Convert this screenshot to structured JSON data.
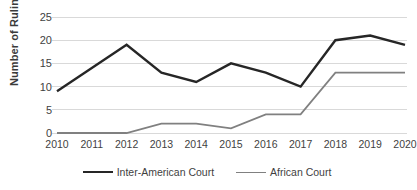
{
  "chart_data": {
    "type": "line",
    "title": "",
    "xlabel": "",
    "ylabel": "Number of Rulings",
    "categories": [
      "2010",
      "2011",
      "2012",
      "2013",
      "2014",
      "2015",
      "2016",
      "2017",
      "2018",
      "2019",
      "2020"
    ],
    "ylim": [
      0,
      25
    ],
    "yticks": [
      "0",
      "5",
      "10",
      "15",
      "20",
      "25"
    ],
    "grid": true,
    "legend_position": "bottom",
    "series": [
      {
        "name": "Inter-American Court",
        "color": "#262626",
        "values": [
          9,
          14,
          19,
          13,
          11,
          15,
          13,
          10,
          20,
          21,
          19
        ]
      },
      {
        "name": "African Court",
        "color": "#808080",
        "values": [
          0,
          0,
          0,
          2,
          2,
          1,
          4,
          4,
          13,
          13,
          13
        ]
      }
    ]
  },
  "axis": {
    "y_title": "Number of Rulings",
    "y_ticks": [
      "25",
      "20",
      "15",
      "10",
      "5",
      "0"
    ],
    "x_ticks": [
      "2010",
      "2011",
      "2012",
      "2013",
      "2014",
      "2015",
      "2016",
      "2017",
      "2018",
      "2019",
      "2020"
    ]
  },
  "legend": {
    "items": [
      {
        "label": "Inter-American Court",
        "color": "#262626"
      },
      {
        "label": "African Court",
        "color": "#808080"
      }
    ]
  }
}
